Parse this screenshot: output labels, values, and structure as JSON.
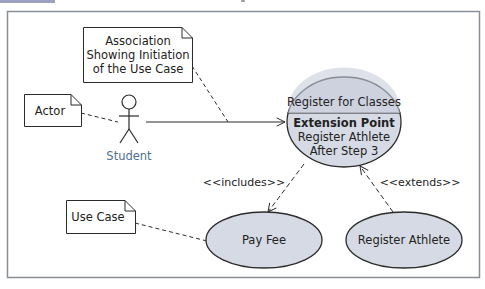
{
  "diagram": {
    "type": "uml-use-case",
    "frame": {
      "border_color": "#8a8e96"
    },
    "colors": {
      "usecase_fill": "#d6dae4",
      "usecase_stroke": "#2b2b2b",
      "actor_label": "#4f6f8f",
      "line": "#2b2b2b"
    },
    "notes": {
      "association": {
        "lines": [
          "Association",
          "Showing Initiation",
          "of the Use Case"
        ]
      },
      "actor": {
        "text": "Actor"
      },
      "use_case": {
        "text": "Use Case"
      }
    },
    "actor": {
      "name": "Student"
    },
    "use_cases": {
      "main": {
        "name": "Register for Classes",
        "extension_title": "Extension Point",
        "extension_lines": [
          "Register Athlete",
          "After Step 3"
        ]
      },
      "pay_fee": {
        "name": "Pay Fee"
      },
      "register_athlete": {
        "name": "Register Athlete"
      }
    },
    "relationships": {
      "includes": "<<includes>>",
      "extends": "<<extends>>"
    }
  }
}
